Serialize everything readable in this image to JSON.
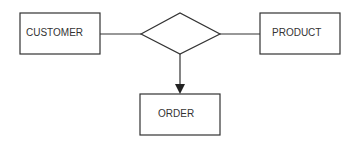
{
  "diagram": {
    "type": "entity-relationship",
    "entities": [
      {
        "id": "customer",
        "label": "CUSTOMER"
      },
      {
        "id": "product",
        "label": "PRODUCT"
      },
      {
        "id": "order",
        "label": "ORDER"
      }
    ],
    "relationship": {
      "shape": "diamond",
      "label": ""
    },
    "connections": [
      {
        "from": "customer",
        "to": "relationship",
        "style": "line"
      },
      {
        "from": "relationship",
        "to": "product",
        "style": "line"
      },
      {
        "from": "relationship",
        "to": "order",
        "style": "arrow"
      }
    ],
    "colors": {
      "stroke": "#333333",
      "background": "#ffffff"
    }
  }
}
